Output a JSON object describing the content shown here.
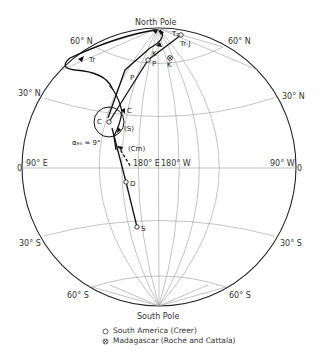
{
  "diagram": {
    "title_top": "North Pole",
    "title_bottom": "South Pole",
    "latitude_labels": {
      "n60_left": "60° N",
      "n60_right": "60° N",
      "n30_left": "30° N",
      "n30_right": "30° N",
      "s30_left": "30° S",
      "s30_right": "30° S",
      "s60_left": "60° S",
      "s60_right": "60° S"
    },
    "longitude_labels": {
      "e90": "90° E",
      "w90": "90° W",
      "e180": "180° E",
      "w180": "180° W",
      "zero_left": "0",
      "zero_right": "0"
    },
    "points": {
      "Tr_J": "Tr-J",
      "T2": "T₂",
      "K_path": "K",
      "K_madagascar": "K",
      "P_open": "P",
      "P_path": "P",
      "Tr": "Tr",
      "C_open": "C",
      "C_path": "C",
      "S_paren": "(S)",
      "Cm_paren": "(Cm)",
      "D": "D",
      "S": "S"
    },
    "alpha_label": "α₉₅ = 9°",
    "colors": {
      "line": "#111111",
      "grid": "#9a9a9a",
      "text": "#333333"
    }
  },
  "legend": {
    "items": [
      {
        "symbol": "open-circle",
        "label": "South America (Creer)"
      },
      {
        "symbol": "circled-x",
        "label": "Madagascar (Roche and Cattala)"
      }
    ]
  }
}
